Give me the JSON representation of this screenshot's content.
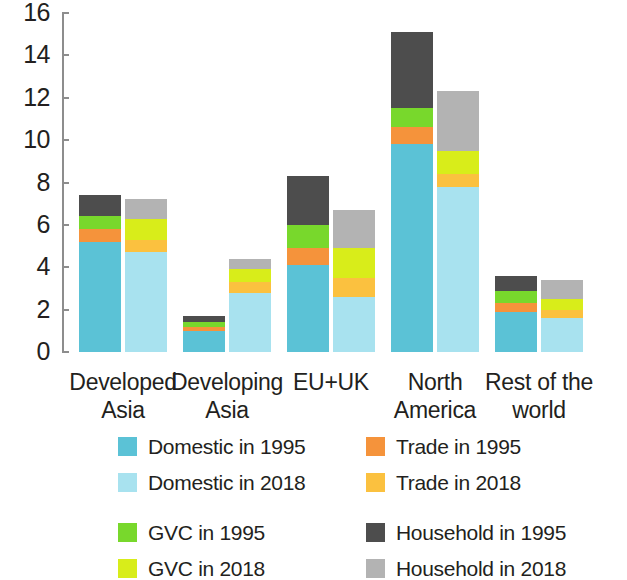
{
  "chart_data": {
    "type": "bar",
    "subtype": "grouped-stacked",
    "title": "",
    "xlabel": "",
    "ylabel": "",
    "ylim": [
      0,
      16
    ],
    "ytick_values": [
      0,
      2,
      4,
      6,
      8,
      10,
      12,
      14,
      16
    ],
    "ytick_labels": [
      "0",
      "2",
      "4",
      "6",
      "8",
      "10",
      "12",
      "14",
      "16"
    ],
    "grid": false,
    "legend_position": "bottom",
    "categories": [
      "Developed Asia",
      "Developing Asia",
      "EU+UK",
      "North America",
      "Rest of the world"
    ],
    "category_lines": [
      [
        "Developed",
        "Asia"
      ],
      [
        "Developing",
        "Asia"
      ],
      [
        "EU+UK"
      ],
      [
        "North",
        "America"
      ],
      [
        "Rest of the",
        "world"
      ]
    ],
    "groups": [
      "1995",
      "2018"
    ],
    "stack_order": [
      "Domestic",
      "Trade",
      "GVC",
      "Household"
    ],
    "series": [
      {
        "name": "Domestic in 1995",
        "year": "1995",
        "component": "Domestic",
        "color": "#5bc2d6",
        "values": [
          5.2,
          1.0,
          4.1,
          9.8,
          1.9
        ]
      },
      {
        "name": "Trade in 1995",
        "year": "1995",
        "component": "Trade",
        "color": "#f5933b",
        "values": [
          0.6,
          0.2,
          0.8,
          0.8,
          0.4
        ]
      },
      {
        "name": "GVC in 1995",
        "year": "1995",
        "component": "GVC",
        "color": "#78d82c",
        "values": [
          0.6,
          0.2,
          1.1,
          0.9,
          0.6
        ]
      },
      {
        "name": "Household in 1995",
        "year": "1995",
        "component": "Household",
        "color": "#4d4d4d",
        "values": [
          1.0,
          0.3,
          2.3,
          3.6,
          0.7
        ]
      },
      {
        "name": "Domestic in 2018",
        "year": "2018",
        "component": "Domestic",
        "color": "#a8e2ef",
        "values": [
          4.7,
          2.8,
          2.6,
          7.8,
          1.6
        ]
      },
      {
        "name": "Trade in 2018",
        "year": "2018",
        "component": "Trade",
        "color": "#fbc13f",
        "values": [
          0.6,
          0.5,
          0.9,
          0.6,
          0.4
        ]
      },
      {
        "name": "GVC in 2018",
        "year": "2018",
        "component": "GVC",
        "color": "#d8ed1a",
        "values": [
          1.0,
          0.6,
          1.4,
          1.1,
          0.5
        ]
      },
      {
        "name": "Household in 2018",
        "year": "2018",
        "component": "Household",
        "color": "#b3b3b3",
        "values": [
          0.9,
          0.5,
          1.8,
          2.8,
          0.9
        ]
      }
    ],
    "totals_1995": [
      7.4,
      1.7,
      8.3,
      15.1,
      3.6
    ],
    "totals_2018": [
      7.2,
      4.4,
      6.7,
      12.3,
      3.4
    ]
  },
  "axis": {
    "y_ticks": [
      "16",
      "14",
      "12",
      "10",
      "8",
      "6",
      "4",
      "2",
      "0"
    ]
  },
  "x_labels": [
    {
      "line1": "Developed",
      "line2": "Asia"
    },
    {
      "line1": "Developing",
      "line2": "Asia"
    },
    {
      "line1": "EU+UK",
      "line2": ""
    },
    {
      "line1": "North",
      "line2": "America"
    },
    {
      "line1": "Rest of the",
      "line2": "world"
    }
  ],
  "legend": {
    "items": [
      {
        "label": "Domestic in 1995",
        "color": "#5bc2d6"
      },
      {
        "label": "Domestic in 2018",
        "color": "#a8e2ef"
      },
      {
        "label": "Trade in 1995",
        "color": "#f5933b"
      },
      {
        "label": "Trade in 2018",
        "color": "#fbc13f"
      },
      {
        "label": "GVC in 1995",
        "color": "#78d82c"
      },
      {
        "label": "GVC in 2018",
        "color": "#d8ed1a"
      },
      {
        "label": "Household in 1995",
        "color": "#4d4d4d"
      },
      {
        "label": "Household in 2018",
        "color": "#b3b3b3"
      }
    ]
  }
}
